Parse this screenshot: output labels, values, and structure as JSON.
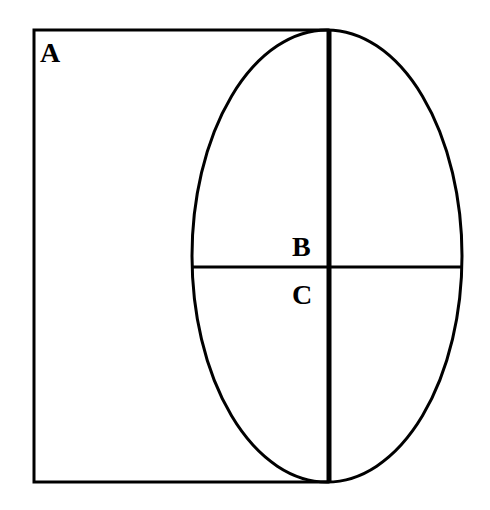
{
  "diagram": {
    "labels": {
      "a": "A",
      "b": "B",
      "c": "C"
    },
    "colors": {
      "stroke": "#000000",
      "background": "#ffffff"
    }
  }
}
